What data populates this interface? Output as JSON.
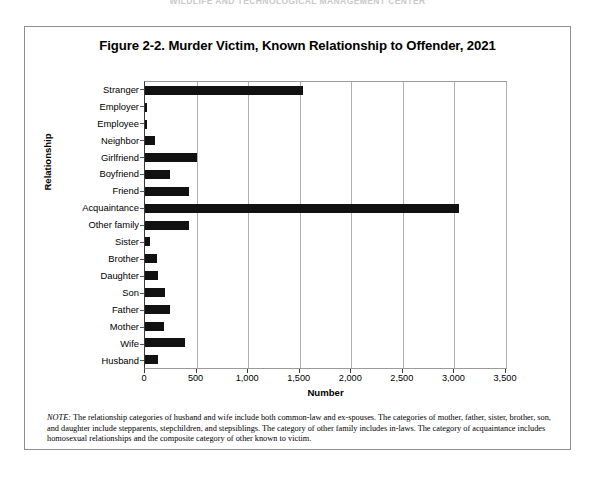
{
  "page_header": "WILDLIFE AND TECHNOLOGICAL MANAGEMENT CENTER",
  "figure": {
    "title": "Figure 2-2. Murder Victim, Known Relationship to Offender, 2021",
    "note_label": "NOTE:",
    "note_text": " The relationship categories of husband and wife include both common-law and ex-spouses. The categories of mother, father, sister, brother, son, and daughter include stepparents, stepchildren, and stepsiblings. The category of other family includes in-laws. The category of acquaintance includes homosexual relationships and the composite category of other known to victim."
  },
  "chart_data": {
    "type": "bar",
    "orientation": "horizontal",
    "title": "Figure 2-2. Murder Victim, Known Relationship to Offender, 2021",
    "xlabel": "Number",
    "ylabel": "Relationship",
    "xlim": [
      0,
      3500
    ],
    "xticks": [
      0,
      500,
      1000,
      1500,
      2000,
      2500,
      3000,
      3500
    ],
    "xtick_labels": [
      "0",
      "500",
      "1,000",
      "1,500",
      "2,000",
      "2,500",
      "3,000",
      "3,500"
    ],
    "grid": true,
    "legend": false,
    "bar_color": "#111111",
    "categories": [
      "Stranger",
      "Employer",
      "Employee",
      "Neighbor",
      "Girlfriend",
      "Boyfriend",
      "Friend",
      "Acquaintance",
      "Other family",
      "Sister",
      "Brother",
      "Daughter",
      "Son",
      "Father",
      "Mother",
      "Wife",
      "Husband"
    ],
    "values": [
      1530,
      20,
      15,
      100,
      505,
      240,
      425,
      3040,
      425,
      50,
      120,
      125,
      195,
      240,
      185,
      390,
      125
    ]
  }
}
